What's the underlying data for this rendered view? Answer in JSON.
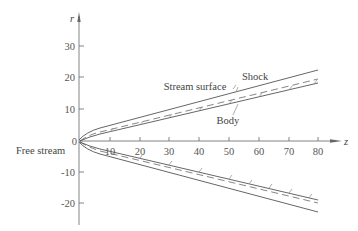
{
  "figure": {
    "axes": {
      "x_label": "z",
      "y_label": "r",
      "x_ticks": [
        "10",
        "20",
        "30",
        "40",
        "50",
        "60",
        "70",
        "80"
      ],
      "y_ticks_pos": [
        "30",
        "20",
        "10"
      ],
      "origin_label": "0",
      "y_ticks_neg": [
        "-10",
        "-20"
      ]
    },
    "labels": {
      "shock": "Shock",
      "stream_surface": "Stream surface",
      "body": "Body",
      "free_stream": "Free stream"
    },
    "colors": {
      "line": "#555555",
      "axis": "#777777",
      "text": "#444444"
    }
  }
}
